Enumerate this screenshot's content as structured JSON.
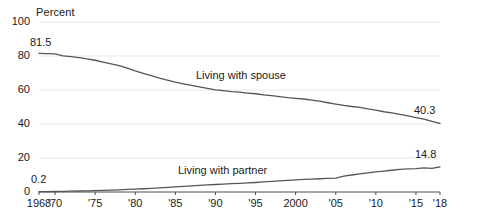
{
  "chart_data": {
    "type": "line",
    "title": "",
    "ylabel": "Percent",
    "xlabel": "",
    "ylim": [
      0,
      100
    ],
    "yticks": [
      0,
      20,
      40,
      60,
      80,
      100
    ],
    "ytick_labels": [
      "0",
      "20",
      "40",
      "60",
      "80",
      "100"
    ],
    "xlim": [
      1968,
      2018
    ],
    "xtick_values": [
      1968,
      1970,
      1975,
      1980,
      1985,
      1990,
      1995,
      2000,
      2005,
      2010,
      2015,
      2018
    ],
    "xtick_labels": [
      "1968",
      "'70",
      "'75",
      "'80",
      "'85",
      "'90",
      "'95",
      "2000",
      "'05",
      "'10",
      "'15",
      "'18"
    ],
    "grid": true,
    "legend_position": "inline",
    "line_color": "#555555",
    "grid_color": "#e8e8e8",
    "axis_color": "#4d4d4d",
    "text_color": "#1a1a1a",
    "series": [
      {
        "name": "Living with spouse",
        "label": "Living with spouse",
        "start_value_label": "81.5",
        "end_value_label": "40.3",
        "x": [
          1968,
          1969,
          1970,
          1971,
          1972,
          1973,
          1974,
          1975,
          1976,
          1977,
          1978,
          1979,
          1980,
          1981,
          1982,
          1983,
          1984,
          1985,
          1986,
          1987,
          1988,
          1989,
          1990,
          1991,
          1992,
          1993,
          1994,
          1995,
          1996,
          1997,
          1998,
          1999,
          2000,
          2001,
          2002,
          2003,
          2004,
          2005,
          2006,
          2007,
          2008,
          2009,
          2010,
          2011,
          2012,
          2013,
          2014,
          2015,
          2016,
          2017,
          2018
        ],
        "values": [
          81.5,
          81.4,
          81.3,
          80.1,
          79.6,
          79.0,
          78.3,
          77.5,
          76.4,
          75.4,
          74.3,
          72.8,
          71.2,
          69.8,
          68.4,
          67.0,
          65.8,
          64.6,
          63.6,
          62.7,
          61.9,
          61.0,
          60.1,
          59.6,
          59.0,
          58.7,
          58.2,
          57.8,
          57.1,
          56.7,
          56.1,
          55.5,
          55.1,
          54.7,
          54.1,
          53.4,
          52.5,
          51.7,
          50.9,
          50.3,
          49.8,
          48.9,
          48.2,
          47.2,
          46.5,
          45.7,
          44.8,
          43.8,
          42.9,
          41.6,
          40.3
        ]
      },
      {
        "name": "Living with partner",
        "label": "Living with partner",
        "start_value_label": "0.2",
        "end_value_label": "14.8",
        "x": [
          1968,
          1969,
          1970,
          1971,
          1972,
          1973,
          1974,
          1975,
          1976,
          1977,
          1978,
          1979,
          1980,
          1981,
          1982,
          1983,
          1984,
          1985,
          1986,
          1987,
          1988,
          1989,
          1990,
          1991,
          1992,
          1993,
          1994,
          1995,
          1996,
          1997,
          1998,
          1999,
          2000,
          2001,
          2002,
          2003,
          2004,
          2005,
          2006,
          2007,
          2008,
          2009,
          2010,
          2011,
          2012,
          2013,
          2014,
          2015,
          2016,
          2017,
          2018
        ],
        "values": [
          0.2,
          0.2,
          0.3,
          0.4,
          0.5,
          0.6,
          0.7,
          0.8,
          0.9,
          1.1,
          1.3,
          1.5,
          1.7,
          1.9,
          2.1,
          2.4,
          2.7,
          3.0,
          3.3,
          3.6,
          3.9,
          4.2,
          4.4,
          4.6,
          4.9,
          5.1,
          5.4,
          5.6,
          5.9,
          6.2,
          6.5,
          6.8,
          7.1,
          7.4,
          7.6,
          7.8,
          8.0,
          8.2,
          9.3,
          10.0,
          10.6,
          11.2,
          11.8,
          12.3,
          12.8,
          13.3,
          13.6,
          13.8,
          14.2,
          13.9,
          14.8
        ]
      }
    ],
    "annotations": [
      {
        "text": "81.5",
        "series": "Living with spouse",
        "position": "start-top"
      },
      {
        "text": "40.3",
        "series": "Living with spouse",
        "position": "end-top"
      },
      {
        "text": "0.2",
        "series": "Living with partner",
        "position": "start-top"
      },
      {
        "text": "14.8",
        "series": "Living with partner",
        "position": "end-top"
      },
      {
        "text": "Living with spouse",
        "series": "Living with spouse",
        "position": "inline"
      },
      {
        "text": "Living with partner",
        "series": "Living with partner",
        "position": "inline"
      }
    ]
  }
}
